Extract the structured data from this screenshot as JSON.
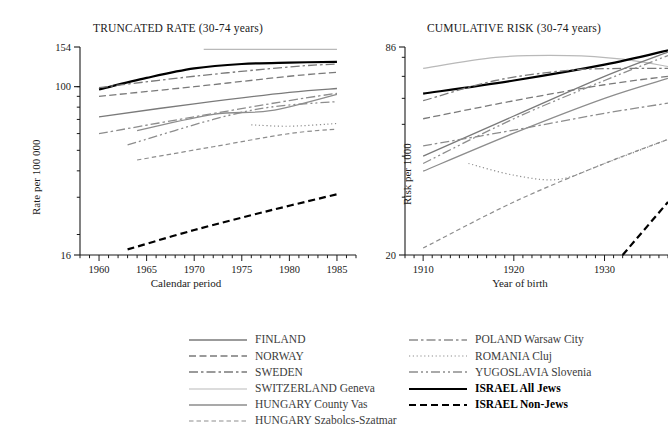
{
  "figure": {
    "background": "#ffffff",
    "ink": "#1a1a1a"
  },
  "panels": [
    {
      "id": "truncated-rate",
      "title": "TRUNCATED RATE (30-74 years)",
      "xlabel": "Calendar period",
      "ylabel": "Rate per 100 000",
      "xticklabels": [
        "1960",
        "1965",
        "1970",
        "1975",
        "1980",
        "1985"
      ],
      "yticklabels": [
        "16",
        "100",
        "154"
      ]
    },
    {
      "id": "cumulative-risk",
      "title": "CUMULATIVE RISK (30-74 years)",
      "xlabel": "Year of birth",
      "ylabel": "Risk per 1000",
      "xticklabels": [
        "1910",
        "1920",
        "1930"
      ],
      "yticklabels": [
        "20",
        "86"
      ]
    }
  ],
  "legend": {
    "columns": [
      [
        {
          "label": "FINLAND",
          "style": "solid",
          "color": "#7a7a7a",
          "width": 1.3,
          "bold": false
        },
        {
          "label": "NORWAY",
          "style": "dashed",
          "color": "#7a7a7a",
          "width": 1.3,
          "bold": false
        },
        {
          "label": "SWEDEN",
          "style": "dashdot",
          "color": "#7a7a7a",
          "width": 1.3,
          "bold": false
        },
        {
          "label": "SWITZERLAND Geneva",
          "style": "solid",
          "color": "#b9b9b9",
          "width": 1.2,
          "bold": false
        },
        {
          "label": "HUNGARY County Vas",
          "style": "solid",
          "color": "#8d8d8d",
          "width": 1.3,
          "bold": false
        },
        {
          "label": "HUNGARY Szabolcs-Szatmar",
          "style": "dashed-fine",
          "color": "#8d8d8d",
          "width": 1.2,
          "bold": false
        }
      ],
      [
        {
          "label": "POLAND Warsaw City",
          "style": "dashdot",
          "color": "#8d8d8d",
          "width": 1.3,
          "bold": false
        },
        {
          "label": "ROMANIA Cluj",
          "style": "dotted",
          "color": "#8d8d8d",
          "width": 1.2,
          "bold": false
        },
        {
          "label": "YUGOSLAVIA Slovenia",
          "style": "dashdotdot",
          "color": "#8d8d8d",
          "width": 1.3,
          "bold": false
        },
        {
          "label": "ISRAEL All Jews",
          "style": "solid",
          "color": "#000000",
          "width": 2.2,
          "bold": true
        },
        {
          "label": "ISRAEL Non-Jews",
          "style": "dashed-bold",
          "color": "#000000",
          "width": 2.2,
          "bold": true
        }
      ]
    ]
  },
  "chart_data": [
    {
      "type": "line",
      "id": "truncated-rate",
      "title": "TRUNCATED RATE (30-74 years)",
      "xlabel": "Calendar period",
      "ylabel": "Rate per 100 000",
      "xlim": [
        1958,
        1987
      ],
      "ylim": [
        16,
        154
      ],
      "yscale": "log",
      "grid": false,
      "xticks": [
        1960,
        1965,
        1970,
        1975,
        1980,
        1985
      ],
      "xticklabels": [
        "1960",
        "1965",
        "1970",
        "1975",
        "1980",
        "1985"
      ],
      "yticks": [
        16,
        100,
        154
      ],
      "yticklabels": [
        "16",
        "100",
        "154"
      ],
      "legend_position": "below-figure",
      "series": [
        {
          "name": "SWITZERLAND Geneva",
          "x": [
            1971,
            1985
          ],
          "y": [
            150,
            150
          ]
        },
        {
          "name": "ISRAEL All Jews",
          "x": [
            1960,
            1965,
            1970,
            1975,
            1980,
            1985
          ],
          "y": [
            97,
            110,
            122,
            128,
            130,
            131
          ]
        },
        {
          "name": "SWEDEN",
          "x": [
            1960,
            1970,
            1980,
            1985
          ],
          "y": [
            99,
            112,
            124,
            128
          ]
        },
        {
          "name": "NORWAY",
          "x": [
            1960,
            1970,
            1980,
            1985
          ],
          "y": [
            90,
            100,
            112,
            117
          ]
        },
        {
          "name": "FINLAND",
          "x": [
            1960,
            1970,
            1980,
            1985
          ],
          "y": [
            72,
            83,
            94,
            98
          ]
        },
        {
          "name": "POLAND Warsaw City",
          "x": [
            1960,
            1970,
            1980,
            1985
          ],
          "y": [
            60,
            72,
            86,
            93
          ]
        },
        {
          "name": "HUNGARY County Vas",
          "x": [
            1964,
            1972,
            1978,
            1985
          ],
          "y": [
            62,
            74,
            77,
            92
          ]
        },
        {
          "name": "YUGOSLAVIA Slovenia",
          "x": [
            1963,
            1972,
            1978,
            1985
          ],
          "y": [
            53,
            70,
            80,
            85
          ]
        },
        {
          "name": "ROMANIA Cluj",
          "x": [
            1976,
            1980,
            1985
          ],
          "y": [
            66,
            65,
            67
          ]
        },
        {
          "name": "HUNGARY Szabolcs-Szatmar",
          "x": [
            1964,
            1972,
            1980,
            1985
          ],
          "y": [
            45,
            52,
            60,
            63
          ]
        },
        {
          "name": "ISRAEL Non-Jews",
          "x": [
            1963,
            1970,
            1978,
            1985
          ],
          "y": [
            17,
            21,
            26,
            31
          ]
        }
      ]
    },
    {
      "type": "line",
      "id": "cumulative-risk",
      "title": "CUMULATIVE RISK (30-74 years)",
      "xlabel": "Year of birth",
      "ylabel": "Risk per 1000",
      "xlim": [
        1908,
        1937
      ],
      "ylim": [
        20,
        86
      ],
      "yscale": "log",
      "grid": false,
      "xticks": [
        1910,
        1920,
        1930
      ],
      "xticklabels": [
        "1910",
        "1920",
        "1930"
      ],
      "yticks": [
        20,
        86
      ],
      "yticklabels": [
        "20",
        "86"
      ],
      "legend_position": "below-figure",
      "series": [
        {
          "name": "SWITZERLAND Geneva",
          "x": [
            1910,
            1918,
            1926,
            1932,
            1937
          ],
          "y": [
            74,
            80,
            81,
            79,
            75
          ]
        },
        {
          "name": "ISRAEL All Jews",
          "x": [
            1910,
            1920,
            1930,
            1937
          ],
          "y": [
            62,
            68,
            76,
            84
          ]
        },
        {
          "name": "SWEDEN",
          "x": [
            1910,
            1918,
            1926,
            1932,
            1937
          ],
          "y": [
            59,
            68,
            73,
            74,
            74
          ]
        },
        {
          "name": "NORWAY",
          "x": [
            1910,
            1920,
            1930,
            1937
          ],
          "y": [
            52,
            59,
            66,
            70
          ]
        },
        {
          "name": "FINLAND",
          "x": [
            1910,
            1920,
            1930,
            1937
          ],
          "y": [
            40,
            53,
            70,
            83
          ]
        },
        {
          "name": "YUGOSLAVIA Slovenia",
          "x": [
            1910,
            1920,
            1930,
            1937
          ],
          "y": [
            38,
            52,
            68,
            81
          ]
        },
        {
          "name": "POLAND Warsaw City",
          "x": [
            1910,
            1920,
            1930,
            1937
          ],
          "y": [
            43,
            48,
            54,
            58
          ]
        },
        {
          "name": "HUNGARY County Vas",
          "x": [
            1910,
            1920,
            1930,
            1937
          ],
          "y": [
            36,
            47,
            60,
            69
          ]
        },
        {
          "name": "ROMANIA Cluj",
          "x": [
            1915,
            1920,
            1925,
            1930,
            1937
          ],
          "y": [
            38,
            35,
            34,
            38,
            45
          ]
        },
        {
          "name": "HUNGARY Szabolcs-Szatmar",
          "x": [
            1910,
            1920,
            1930,
            1937
          ],
          "y": [
            21,
            29,
            38,
            45
          ]
        },
        {
          "name": "ISRAEL Non-Jews",
          "x": [
            1932,
            1937
          ],
          "y": [
            20,
            29
          ]
        }
      ]
    }
  ]
}
